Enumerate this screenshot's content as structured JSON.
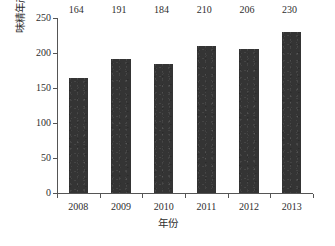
{
  "chart_data": {
    "type": "bar",
    "title": "",
    "subtitle": "",
    "categories": [
      "2008",
      "2009",
      "2010",
      "2011",
      "2012",
      "2013"
    ],
    "values": [
      164,
      191,
      184,
      210,
      206,
      230
    ],
    "data_labels": [
      "164",
      "191",
      "184",
      "210",
      "206",
      "230"
    ],
    "xlabel": "年份",
    "ylabel": "味精年产量/万t",
    "ylim": [
      0,
      250
    ],
    "y_ticks": [
      0,
      50,
      100,
      150,
      200,
      250
    ],
    "y_tick_labels": [
      "0",
      "50",
      "100",
      "150",
      "200",
      "250"
    ],
    "grid": false,
    "legend": null,
    "bar_color": "#343434",
    "axis_color": "#555555",
    "text_color": "#2e2e2e",
    "background_color": "#ffffff"
  }
}
